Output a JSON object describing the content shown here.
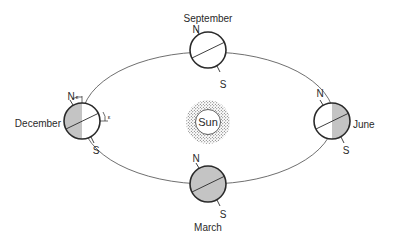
{
  "diagram": {
    "type": "earth-orbit-seasons",
    "colors": {
      "line": "#3a3a3a",
      "shade": "#c4c4c4",
      "background": "#ffffff",
      "stipple": "#555555"
    },
    "sun": {
      "label": "Sun"
    },
    "positions": [
      {
        "id": "september",
        "label": "September",
        "north": "N",
        "south": "S",
        "shading": "none"
      },
      {
        "id": "december",
        "label": "December",
        "north": "N",
        "south": "S",
        "shading": "left-half",
        "tilt_symbol": "ε"
      },
      {
        "id": "june",
        "label": "June",
        "north": "N",
        "south": "S",
        "shading": "right-half"
      },
      {
        "id": "march",
        "label": "March",
        "north": "N",
        "south": "S",
        "shading": "full"
      }
    ]
  }
}
